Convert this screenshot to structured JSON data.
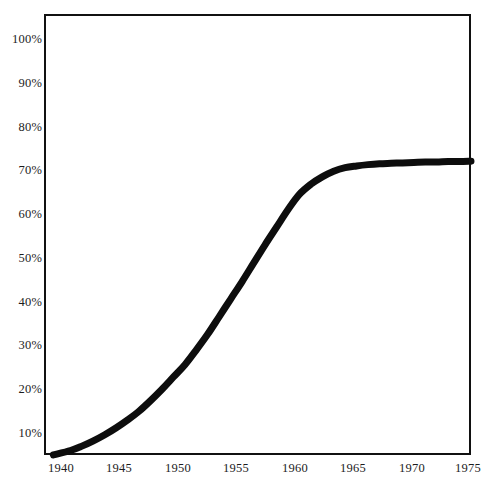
{
  "chart_data": {
    "type": "line",
    "title": "",
    "subtitle": "",
    "xlabel": "",
    "ylabel": "",
    "xlim": [
      1938.5,
      1975
    ],
    "ylim": [
      5,
      100
    ],
    "grid": false,
    "legend": null,
    "y_tick_labels": [
      "10%",
      "20%",
      "30%",
      "40%",
      "50%",
      "60%",
      "70%",
      "80%",
      "90%",
      "100%"
    ],
    "y_tick_values": [
      10,
      20,
      30,
      40,
      50,
      60,
      70,
      80,
      90,
      100
    ],
    "x_tick_labels": [
      "1940",
      "1945",
      "1950",
      "1955",
      "1960",
      "1965",
      "1970",
      "1975"
    ],
    "x_tick_values": [
      1940,
      1945,
      1950,
      1955,
      1960,
      1965,
      1970,
      1975
    ],
    "series": [
      {
        "name": "adoption",
        "x": [
          1938.5,
          1940,
          1941,
          1942,
          1943,
          1944,
          1945,
          1946,
          1947,
          1948,
          1949,
          1950,
          1951,
          1952,
          1953,
          1954,
          1955,
          1956,
          1957,
          1958,
          1959,
          1960,
          1961,
          1962,
          1963,
          1964,
          1965,
          1966,
          1967,
          1968,
          1969,
          1970,
          1971,
          1972,
          1973,
          1974,
          1975
        ],
        "values": [
          5.0,
          6.0,
          7.0,
          8.2,
          9.6,
          11.2,
          13.0,
          15.0,
          17.4,
          20.0,
          22.8,
          25.6,
          29.0,
          32.6,
          36.6,
          40.6,
          44.6,
          48.8,
          53.0,
          57.0,
          61.0,
          64.5,
          66.8,
          68.5,
          69.8,
          70.6,
          71.0,
          71.3,
          71.5,
          71.6,
          71.7,
          71.8,
          71.9,
          71.9,
          72.0,
          72.0,
          72.1
        ]
      }
    ]
  },
  "axes": {
    "y_labels": [
      "100%",
      "90%",
      "80%",
      "70%",
      "60%",
      "50%",
      "40%",
      "30%",
      "20%",
      "10%"
    ],
    "x_labels": [
      "1940",
      "1945",
      "1950",
      "1955",
      "1960",
      "1965",
      "1970",
      "1975"
    ]
  }
}
